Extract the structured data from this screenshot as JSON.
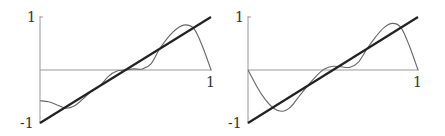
{
  "chart_data": [
    {
      "type": "line",
      "title": "",
      "xlabel": "",
      "ylabel": "",
      "xlim": [
        0,
        1
      ],
      "ylim": [
        -1,
        1
      ],
      "grid": false,
      "legend": null,
      "x_tick_labels": [
        "1"
      ],
      "y_tick_labels": [
        "1",
        "-1"
      ],
      "series": [
        {
          "name": "target line (thick)",
          "style": "thick",
          "color": "#222222",
          "x": [
            0,
            1
          ],
          "y": [
            -1,
            1
          ]
        },
        {
          "name": "approximation (thin)",
          "style": "thin",
          "color": "#666666",
          "x": [
            0,
            0.05,
            0.1,
            0.15,
            0.2,
            0.25,
            0.3,
            0.35,
            0.4,
            0.45,
            0.5,
            0.55,
            0.6,
            0.65,
            0.7,
            0.75,
            0.8,
            0.85,
            0.9,
            0.95,
            1.0
          ],
          "y": [
            -0.58,
            -0.6,
            -0.66,
            -0.72,
            -0.68,
            -0.55,
            -0.4,
            -0.3,
            -0.12,
            -0.02,
            0.0,
            0.02,
            0.02,
            0.12,
            0.4,
            0.62,
            0.78,
            0.85,
            0.78,
            0.45,
            0.0
          ]
        }
      ]
    },
    {
      "type": "line",
      "title": "",
      "xlabel": "",
      "ylabel": "",
      "xlim": [
        0,
        1
      ],
      "ylim": [
        -1,
        1
      ],
      "grid": false,
      "legend": null,
      "x_tick_labels": [
        "1"
      ],
      "y_tick_labels": [
        "1",
        "-1"
      ],
      "series": [
        {
          "name": "target line (thick)",
          "style": "thick",
          "color": "#222222",
          "x": [
            0,
            1
          ],
          "y": [
            -1,
            1
          ]
        },
        {
          "name": "approximation (thin)",
          "style": "thin",
          "color": "#666666",
          "x": [
            0,
            0.05,
            0.1,
            0.15,
            0.2,
            0.25,
            0.3,
            0.35,
            0.4,
            0.45,
            0.5,
            0.55,
            0.6,
            0.65,
            0.7,
            0.75,
            0.8,
            0.85,
            0.9,
            0.95,
            1.0
          ],
          "y": [
            0.0,
            -0.3,
            -0.55,
            -0.72,
            -0.78,
            -0.7,
            -0.5,
            -0.3,
            -0.12,
            0.02,
            0.07,
            0.06,
            0.05,
            0.15,
            0.4,
            0.62,
            0.8,
            0.88,
            0.8,
            0.45,
            0.0
          ]
        }
      ]
    }
  ],
  "panels": [
    {
      "y_top_label": "1",
      "y_bottom_label": "-1",
      "x_right_label": "1"
    },
    {
      "y_top_label": "1",
      "y_bottom_label": "-1",
      "x_right_label": "1"
    }
  ]
}
